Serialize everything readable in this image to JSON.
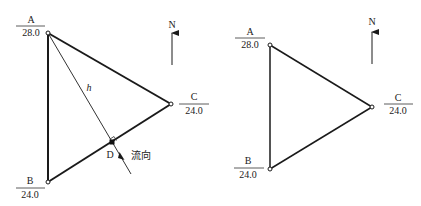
{
  "colors": {
    "line": "#1a1a1a",
    "thin_line": "#333333",
    "background": "#ffffff"
  },
  "left_diagram": {
    "points": {
      "A": {
        "name": "A",
        "value": "28.0"
      },
      "B": {
        "name": "B",
        "value": "24.0"
      },
      "C": {
        "name": "C",
        "value": "24.0"
      },
      "D": {
        "name": "D"
      }
    },
    "height_label": "h",
    "flow_label": "流向",
    "north_label": "N"
  },
  "right_diagram": {
    "points": {
      "A": {
        "name": "A",
        "value": "28.0"
      },
      "B": {
        "name": "B",
        "value": "24.0"
      },
      "C": {
        "name": "C",
        "value": "24.0"
      }
    },
    "north_label": "N"
  }
}
